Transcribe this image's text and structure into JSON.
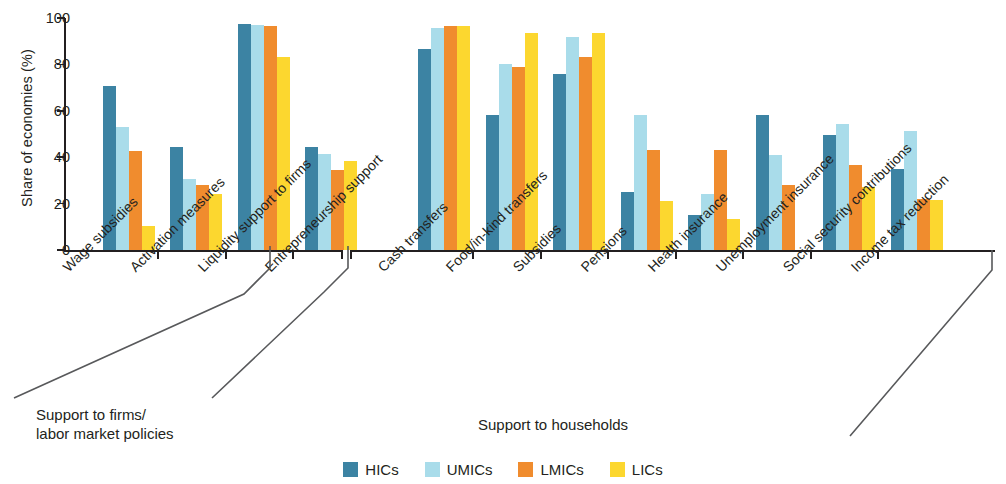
{
  "chart_data": {
    "type": "bar",
    "title": "",
    "xlabel": "",
    "ylabel": "Share of economies (%)",
    "ylim": [
      0,
      100
    ],
    "yticks": [
      0,
      20,
      40,
      60,
      80,
      100
    ],
    "grid": false,
    "legend_position": "bottom-center",
    "categories": [
      "Wage subsidies",
      "Activation measures",
      "Liquidity support to firms",
      "Entrepreneurship support",
      "Cash transfers",
      "Food/in-kind transfers",
      "Subsidies",
      "Pensions",
      "Health insurance",
      "Unemployment insurance",
      "Social security contributions",
      "Income tax reduction"
    ],
    "series": [
      {
        "name": "HICs",
        "color": "#3c83a3",
        "values": [
          70.5,
          44.5,
          97.5,
          44.5,
          86.5,
          58,
          76,
          25,
          15,
          58,
          49.5,
          35
        ]
      },
      {
        "name": "UMICs",
        "color": "#a9dcea",
        "values": [
          53,
          30.5,
          97,
          41.5,
          95.5,
          80,
          92,
          58,
          24,
          41,
          54.5,
          51.5
        ]
      },
      {
        "name": "LMICs",
        "color": "#f08c2e",
        "values": [
          42.5,
          28,
          96.5,
          34.5,
          96.5,
          79,
          83,
          43,
          43,
          28,
          36.5,
          22
        ]
      },
      {
        "name": "LICs",
        "color": "#fcd72f",
        "values": [
          10.5,
          24,
          83,
          38.5,
          96.5,
          93.5,
          93.5,
          21,
          13.5,
          null,
          27,
          21.5
        ]
      }
    ]
  },
  "sections": [
    {
      "caption": "Support to firms/\nlabor market policies",
      "categories": 4
    },
    {
      "caption": "Support to households",
      "categories": 8
    }
  ],
  "legend": {
    "items": [
      {
        "label": "HICs",
        "color": "#3c83a3"
      },
      {
        "label": "UMICs",
        "color": "#a9dcea"
      },
      {
        "label": "LMICs",
        "color": "#f08c2e"
      },
      {
        "label": "LICs",
        "color": "#fcd72f"
      }
    ]
  }
}
